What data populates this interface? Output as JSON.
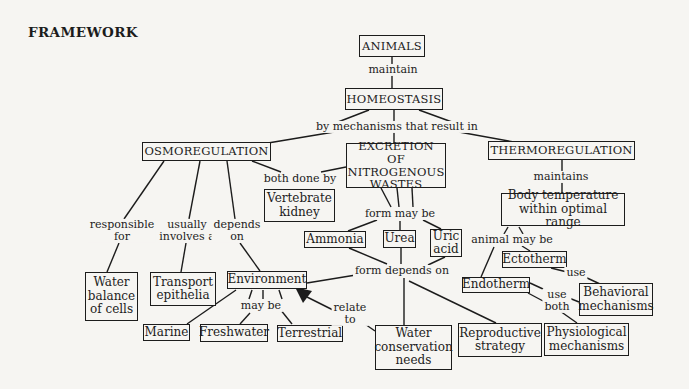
{
  "title": "FRAMEWORK",
  "nodes": {
    "animals": "ANIMALS",
    "homeostasis": "HOMEOSTASIS",
    "osmoregulation": "OSMOREGULATION",
    "excretion": "EXCRETION OF\nNITROGENOUS\nWASTES",
    "thermoregulation": "THERMOREGULATION",
    "vertebrate_kidney": "Vertebrate\nkidney",
    "body_temperature": "Body temperature\nwithin optimal range",
    "ammonia": "Ammonia",
    "urea": "Urea",
    "uric_acid": "Uric\nacid",
    "ectotherm": "Ectotherm",
    "endotherm": "Endotherm",
    "behavioral_mechanisms": "Behavioral\nmechanisms",
    "physiological_mechanisms": "Physiological\nmechanisms",
    "reproductive_strategy": "Reproductive\nstrategy",
    "water_conservation": "Water\nconservation\nneeds",
    "environment": "Environment",
    "marine": "Marine",
    "freshwater": "Freshwater",
    "terrestrial": "Terrestrial",
    "water_balance": "Water\nbalance\nof cells",
    "transport_epithelia": "Transport\nepithelia"
  },
  "links": {
    "maintain": "maintain",
    "by_mechanisms": "by mechanisms that result in",
    "both_done_by": "both done by",
    "responsible_for": "responsible\nfor",
    "usually_involves": "usually\ninvolves a",
    "depends_on": "depends\non",
    "form_may_be": "form may be",
    "maintains": "maintains",
    "animal_may_be": "animal may be",
    "use": "use",
    "use_both": "use\nboth",
    "form_depends_on": "form depends on",
    "may_be": "may be",
    "relate_to": "relate\nto"
  },
  "colors": {
    "ink": "#1c1c1c",
    "paper": "#f6f5f2"
  }
}
